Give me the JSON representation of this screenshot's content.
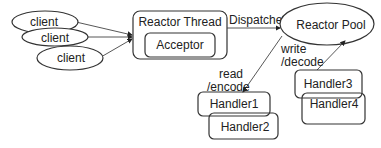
{
  "diagram": {
    "clients": [
      {
        "label": "client"
      },
      {
        "label": "client"
      },
      {
        "label": "client"
      }
    ],
    "reactor_thread": {
      "label": "Reactor Thread",
      "acceptor_label": "Acceptor"
    },
    "dispatcher_label": "Dispatcher",
    "reactor_pool": {
      "label": "Reactor Pool"
    },
    "read_encode_label": [
      "read",
      "/encode"
    ],
    "write_decode_label": [
      "write",
      "/decode"
    ],
    "handlers": [
      {
        "label": "Handler1"
      },
      {
        "label": "Handler2"
      },
      {
        "label": "Handler3"
      },
      {
        "label": "Handler4"
      }
    ],
    "colors": {
      "stroke": "#333333",
      "background": "#ffffff",
      "text": "#222222"
    }
  }
}
